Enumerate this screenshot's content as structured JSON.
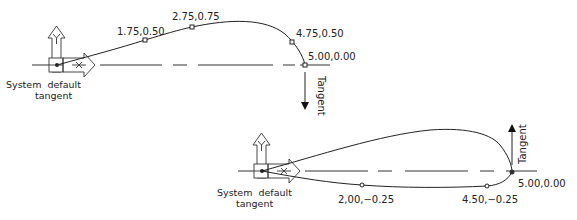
{
  "diagram": {
    "top": {
      "caption_line1": "System  default",
      "caption_line2": "tangent",
      "points": [
        {
          "label": "1.75,0.50"
        },
        {
          "label": "2.75,0.75"
        },
        {
          "label": "4.75,0.50"
        },
        {
          "label": "5.00,0.00"
        }
      ],
      "tangent_label": "Tangent",
      "tangent_direction": "down"
    },
    "bottom": {
      "caption_line1": "System  default",
      "caption_line2": "tangent",
      "points": [
        {
          "label": "2,00,−0.25"
        },
        {
          "label": "4.50,−0.25"
        },
        {
          "label": "5.00,0.00"
        }
      ],
      "tangent_label": "Tangent",
      "tangent_direction": "up"
    },
    "ucs_icon": {
      "x_axis": "X",
      "y_axis": "Y"
    }
  }
}
